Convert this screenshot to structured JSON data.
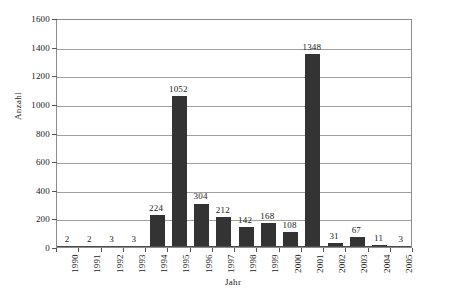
{
  "chart_data": {
    "type": "bar",
    "title": "",
    "xlabel": "Jahr",
    "ylabel": "Anzahl",
    "categories": [
      "1990",
      "1991",
      "1992",
      "1993",
      "1994",
      "1995",
      "1996",
      "1997",
      "1998",
      "1999",
      "2000",
      "2001",
      "2002",
      "2003",
      "2004",
      "2005"
    ],
    "values": [
      2,
      2,
      3,
      3,
      224,
      1052,
      304,
      212,
      142,
      168,
      108,
      1348,
      31,
      67,
      11,
      3
    ],
    "value_labels": [
      "2",
      "2",
      "3",
      "3",
      "224",
      "1052",
      "304",
      "212",
      "142",
      "168",
      "108",
      "1348",
      "31",
      "67",
      "11",
      "3"
    ],
    "ylim": [
      0,
      1600
    ],
    "ytick_values": [
      0,
      200,
      400,
      600,
      800,
      1000,
      1200,
      1400,
      1600
    ],
    "ytick_labels": [
      "0",
      "200",
      "400",
      "600",
      "800",
      "1000",
      "1200",
      "1400",
      "1600"
    ],
    "grid": true,
    "legend": "none",
    "series_color": "#333333",
    "grid_color": "#a0a0a0",
    "axis_color": "#8c8c8c"
  }
}
